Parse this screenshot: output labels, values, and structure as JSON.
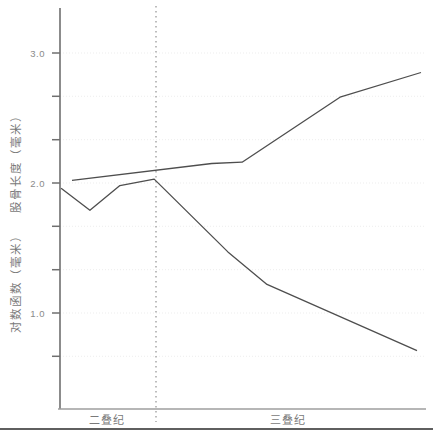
{
  "chart_data": {
    "type": "line",
    "title": "",
    "ylabel_upper": "股骨长度（毫米）",
    "ylabel_lower": "对数函数（毫米）",
    "xlabel": "",
    "x_categories": [
      {
        "label": "二叠纪",
        "x_frac": 0.129
      },
      {
        "label": "三叠纪",
        "x_frac": 0.625
      }
    ],
    "period_boundary_x_frac": 0.263,
    "y_axis": {
      "labeled_ticks": [
        {
          "value": 3.0,
          "label": "3.0"
        },
        {
          "value": 2.0,
          "label": "2.0"
        },
        {
          "value": 1.0,
          "label": "1.0"
        }
      ],
      "minor_tick_values": [
        2.667,
        2.333,
        1.667,
        1.333,
        0.667
      ],
      "range_shown": [
        0.26,
        3.35
      ],
      "grid": "faint-dotted-horizontal"
    },
    "legend": "none",
    "series": [
      {
        "name": "股骨长度（毫米）",
        "points": [
          [
            0.033,
            2.02
          ],
          [
            0.416,
            2.15
          ],
          [
            0.499,
            2.16
          ],
          [
            0.767,
            2.66
          ],
          [
            0.989,
            2.85
          ]
        ]
      },
      {
        "name": "对数函数（毫米）",
        "points": [
          [
            0.003,
            1.96
          ],
          [
            0.082,
            1.79
          ],
          [
            0.164,
            1.98
          ],
          [
            0.258,
            2.03
          ],
          [
            0.46,
            1.47
          ],
          [
            0.567,
            1.22
          ],
          [
            0.978,
            0.71
          ]
        ]
      }
    ]
  },
  "colors": {
    "series_line": "#4e4e4e",
    "y_axis": "#6f6f6f",
    "x_axis": "#9e9e9e",
    "tick": "#6f6f6f",
    "grid": "#ededed",
    "label_text": "#8a8a8a",
    "axis_title_text": "#7a7a7a",
    "boundary_line": "#9a9a9a",
    "edge_artifact": "#5f5f5f"
  }
}
